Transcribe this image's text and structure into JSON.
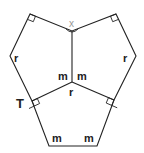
{
  "diagram": {
    "labels": {
      "x": "x",
      "r_left": "r",
      "r_right": "r",
      "r_center": "r",
      "m_center_left": "m",
      "m_center_right": "m",
      "m_bottom_left": "m",
      "m_bottom_right": "m",
      "T": "T"
    },
    "colors": {
      "stroke": "#222222",
      "angle_label": "#999999"
    }
  }
}
